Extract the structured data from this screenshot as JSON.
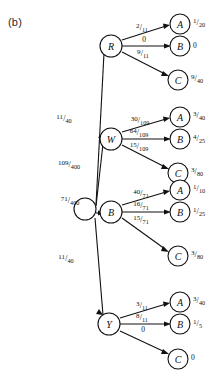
{
  "figure": {
    "panel_label": "(b)",
    "root": {
      "label": "",
      "name": "root-node"
    },
    "level1": [
      {
        "id": "R",
        "label": "R",
        "edge_from_root": {
          "num": "11",
          "den": "40"
        }
      },
      {
        "id": "W",
        "label": "W",
        "edge_from_root": {
          "num": "109",
          "den": "400"
        }
      },
      {
        "id": "B",
        "label": "B",
        "edge_from_root": {
          "num": "71",
          "den": "400"
        }
      },
      {
        "id": "Y",
        "label": "Y",
        "edge_from_root": {
          "num": "11",
          "den": "40"
        }
      }
    ],
    "groups": [
      {
        "parent": "R",
        "leaves": [
          {
            "label": "A",
            "edge": {
              "num": "2",
              "den": "11"
            },
            "value": {
              "num": "1",
              "den": "20"
            }
          },
          {
            "label": "B",
            "edge": {
              "whole": "0"
            },
            "value": {
              "whole": "0"
            }
          },
          {
            "label": "C",
            "edge": {
              "num": "9",
              "den": "11"
            },
            "value": {
              "num": "9",
              "den": "40"
            }
          }
        ]
      },
      {
        "parent": "W",
        "leaves": [
          {
            "label": "A",
            "edge": {
              "num": "30",
              "den": "109"
            },
            "value": {
              "num": "3",
              "den": "40"
            }
          },
          {
            "label": "B",
            "edge": {
              "num": "64",
              "den": "109"
            },
            "value": {
              "num": "4",
              "den": "25"
            }
          },
          {
            "label": "C",
            "edge": {
              "num": "15",
              "den": "109"
            },
            "value": {
              "num": "3",
              "den": "80"
            }
          }
        ]
      },
      {
        "parent": "B",
        "leaves": [
          {
            "label": "A",
            "edge": {
              "num": "40",
              "den": "71"
            },
            "value": {
              "num": "1",
              "den": "10"
            }
          },
          {
            "label": "B",
            "edge": {
              "num": "16",
              "den": "71"
            },
            "value": {
              "num": "1",
              "den": "25"
            }
          },
          {
            "label": "C",
            "edge": {
              "num": "15",
              "den": "71"
            },
            "value": {
              "num": "3",
              "den": "80"
            }
          }
        ]
      },
      {
        "parent": "Y",
        "leaves": [
          {
            "label": "A",
            "edge": {
              "num": "3",
              "den": "11"
            },
            "value": {
              "num": "3",
              "den": "40"
            }
          },
          {
            "label": "B",
            "edge": {
              "num": "8",
              "den": "11"
            },
            "value": {
              "num": "1",
              "den": "5"
            }
          },
          {
            "label": "C",
            "edge": {
              "whole": "0"
            },
            "value": {
              "whole": "0"
            }
          }
        ]
      }
    ]
  }
}
